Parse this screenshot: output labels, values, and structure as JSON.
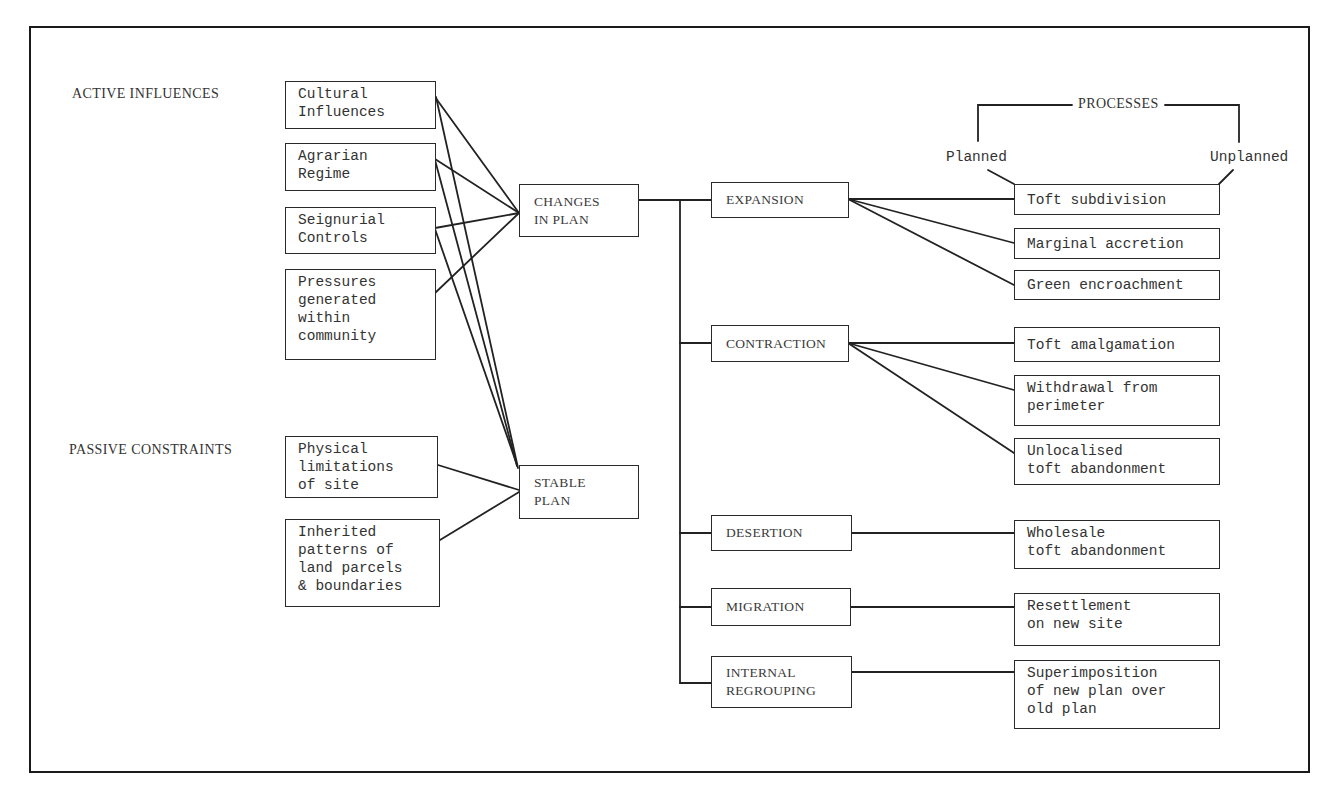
{
  "diagram": {
    "section_labels": {
      "active": "ACTIVE INFLUENCES",
      "passive": "PASSIVE CONSTRAINTS"
    },
    "active_influences": [
      {
        "id": "cultural",
        "label": "Cultural\nInfluences"
      },
      {
        "id": "agrarian",
        "label": "Agrarian\nRegime"
      },
      {
        "id": "seigniorial",
        "label": "Seignurial\nControls"
      },
      {
        "id": "pressures",
        "label": "Pressures\ngenerated\nwithin\ncommunity"
      }
    ],
    "passive_constraints": [
      {
        "id": "physical",
        "label": "Physical\nlimitations\nof site"
      },
      {
        "id": "inherited",
        "label": "Inherited\npatterns of\nland parcels\n& boundaries"
      }
    ],
    "outcomes": [
      {
        "id": "changes",
        "label": "CHANGES\nIN PLAN"
      },
      {
        "id": "stable",
        "label": "STABLE\nPLAN"
      }
    ],
    "change_types": [
      {
        "id": "expansion",
        "label": "EXPANSION"
      },
      {
        "id": "contraction",
        "label": "CONTRACTION"
      },
      {
        "id": "desertion",
        "label": "DESERTION"
      },
      {
        "id": "migration",
        "label": "MIGRATION"
      },
      {
        "id": "internal",
        "label": "INTERNAL\nREGROUPING"
      }
    ],
    "processes_header": {
      "title": "PROCESSES",
      "left": "Planned",
      "right": "Unplanned"
    },
    "processes": [
      {
        "id": "toft-subdivision",
        "label": "Toft subdivision",
        "parent": "expansion"
      },
      {
        "id": "marginal-accretion",
        "label": "Marginal accretion",
        "parent": "expansion"
      },
      {
        "id": "green-encroachment",
        "label": "Green encroachment",
        "parent": "expansion"
      },
      {
        "id": "toft-amalgamation",
        "label": "Toft amalgamation",
        "parent": "contraction"
      },
      {
        "id": "withdrawal",
        "label": "Withdrawal from\nperimeter",
        "parent": "contraction"
      },
      {
        "id": "unlocalised",
        "label": "Unlocalised\ntoft abandonment",
        "parent": "contraction"
      },
      {
        "id": "wholesale",
        "label": "Wholesale\ntoft abandonment",
        "parent": "desertion"
      },
      {
        "id": "resettlement",
        "label": "Resettlement\non new site",
        "parent": "migration"
      },
      {
        "id": "superimposition",
        "label": "Superimposition\nof new plan over\nold plan",
        "parent": "internal"
      }
    ],
    "connections": [
      [
        "cultural",
        "changes"
      ],
      [
        "cultural",
        "stable"
      ],
      [
        "agrarian",
        "changes"
      ],
      [
        "agrarian",
        "stable"
      ],
      [
        "seigniorial",
        "changes"
      ],
      [
        "seigniorial",
        "stable"
      ],
      [
        "pressures",
        "changes"
      ],
      [
        "physical",
        "stable"
      ],
      [
        "inherited",
        "stable"
      ],
      [
        "changes",
        "expansion"
      ],
      [
        "changes",
        "contraction"
      ],
      [
        "changes",
        "desertion"
      ],
      [
        "changes",
        "migration"
      ],
      [
        "changes",
        "internal"
      ]
    ]
  }
}
